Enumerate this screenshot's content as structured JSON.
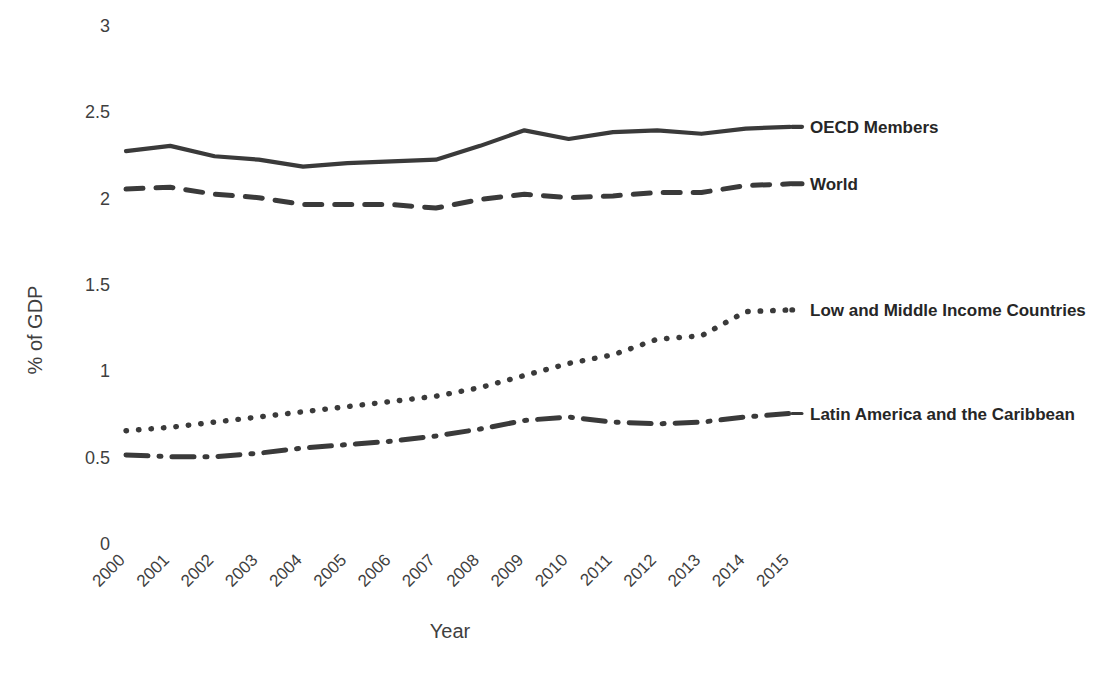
{
  "chart_data": {
    "type": "line",
    "title": "",
    "xlabel": "Year",
    "ylabel": "% of GDP",
    "categories": [
      "2000",
      "2001",
      "2002",
      "2003",
      "2004",
      "2005",
      "2006",
      "2007",
      "2008",
      "2009",
      "2010",
      "2011",
      "2012",
      "2013",
      "2014",
      "2015"
    ],
    "x": [
      2000,
      2001,
      2002,
      2003,
      2004,
      2005,
      2006,
      2007,
      2008,
      2009,
      2010,
      2011,
      2012,
      2013,
      2014,
      2015
    ],
    "ylim": [
      0,
      3
    ],
    "yticks": [
      "0",
      "0.5",
      "1",
      "1.5",
      "2",
      "2.5",
      "3"
    ],
    "ytick_values": [
      0,
      0.5,
      1,
      1.5,
      2,
      2.5,
      3
    ],
    "grid": false,
    "legend_position": "inline-right-end-of-line",
    "series": [
      {
        "name": "OECD Members",
        "style": "solid",
        "values": [
          2.27,
          2.3,
          2.24,
          2.22,
          2.18,
          2.2,
          2.21,
          2.22,
          2.3,
          2.39,
          2.34,
          2.38,
          2.39,
          2.37,
          2.4,
          2.41
        ]
      },
      {
        "name": "World",
        "style": "dashed",
        "values": [
          2.05,
          2.06,
          2.02,
          2.0,
          1.96,
          1.96,
          1.96,
          1.94,
          1.99,
          2.02,
          2.0,
          2.01,
          2.03,
          2.03,
          2.07,
          2.08
        ]
      },
      {
        "name": "Low and Middle Income Countries",
        "style": "dotted",
        "values": [
          0.65,
          0.67,
          0.7,
          0.73,
          0.76,
          0.79,
          0.82,
          0.85,
          0.9,
          0.97,
          1.04,
          1.09,
          1.18,
          1.2,
          1.34,
          1.35
        ]
      },
      {
        "name": "Latin America and the Caribbean",
        "style": "dashdot",
        "values": [
          0.51,
          0.5,
          0.5,
          0.52,
          0.55,
          0.57,
          0.59,
          0.62,
          0.66,
          0.71,
          0.73,
          0.7,
          0.69,
          0.7,
          0.73,
          0.75
        ]
      }
    ],
    "colors": {
      "line": "#3a3a3a",
      "text": "#3f3f3f",
      "background": "#ffffff"
    }
  }
}
